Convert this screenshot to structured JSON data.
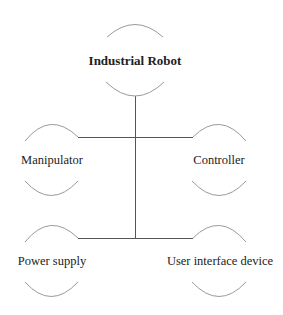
{
  "diagram": {
    "type": "hierarchy",
    "root": {
      "id": "industrial-robot",
      "label": "Industrial Robot",
      "emphasis": "bold"
    },
    "children": [
      {
        "id": "manipulator",
        "label": "Manipulator",
        "level": 1,
        "side": "left"
      },
      {
        "id": "controller",
        "label": "Controller",
        "level": 1,
        "side": "right"
      },
      {
        "id": "power-supply",
        "label": "Power supply",
        "level": 2,
        "side": "left"
      },
      {
        "id": "user-interface-device",
        "label": "User interface device",
        "level": 2,
        "side": "right"
      }
    ],
    "edges": [
      {
        "from": "industrial-robot",
        "to": "manipulator"
      },
      {
        "from": "industrial-robot",
        "to": "controller"
      },
      {
        "from": "industrial-robot",
        "to": "power-supply"
      },
      {
        "from": "industrial-robot",
        "to": "user-interface-device"
      }
    ],
    "colors": {
      "connector": "#555555",
      "arc": "#9a9a9a",
      "text": "#222222"
    }
  }
}
